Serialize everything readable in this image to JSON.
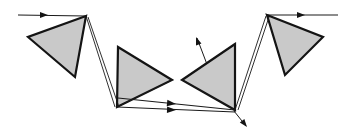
{
  "figure": {
    "width": 342,
    "height": 137,
    "background_color": "#ffffff"
  },
  "style": {
    "prism_fill": "#c9c9c9",
    "prism_stroke": "#141414",
    "prism_stroke_width": 2.2,
    "ray_stroke": "#1a1a1a",
    "ray_stroke_width": 1.1,
    "thin_ray_stroke_width": 0.9,
    "arrow_fill": "#141414"
  },
  "chart_data": {
    "type": "diagram",
    "xlabel": "",
    "ylabel": "",
    "xlim": [
      0,
      342
    ],
    "ylim": [
      0,
      137
    ],
    "grid": false,
    "legend": "none",
    "prisms": [
      {
        "name": "prism-1",
        "label": "upper-left prism",
        "points": "86,16 28,37 75,77",
        "fill": "#c9c9c9"
      },
      {
        "name": "prism-2",
        "label": "lower-left-center prism",
        "points": "118,47 172,80 117,107",
        "fill": "#c9c9c9"
      },
      {
        "name": "prism-3",
        "label": "lower-right-center prism",
        "points": "235,44 182,80 235,110",
        "fill": "#c9c9c9"
      },
      {
        "name": "prism-4",
        "label": "upper-right prism",
        "points": "267,15 323,37 285,75",
        "fill": "#c9c9c9"
      }
    ],
    "rays": [
      {
        "name": "input-ray",
        "label": "incoming beam from left",
        "path": "M18,15 L86,16",
        "width": 1.2,
        "arrows": [
          {
            "name": "input-ray-arrowhead",
            "x": 48,
            "y": 15,
            "angle": 0,
            "size": 8
          }
        ]
      },
      {
        "name": "descending-ray-a",
        "label": "beam from prism 1 apex to prism 2 base (upper)",
        "path": "M86,16 L115,107",
        "width": 0.9,
        "arrows": []
      },
      {
        "name": "descending-ray-b",
        "label": "beam from prism 1 apex to prism 2 base (lower)",
        "path": "M88,17 L119,107",
        "width": 0.9,
        "arrows": []
      },
      {
        "name": "prism2-internal-ray",
        "label": "internal beam across prism 2 to right vertex",
        "path": "M117,107 L172,80",
        "width": 0.9,
        "arrows": []
      },
      {
        "name": "horizontal-ray-upper",
        "label": "upper horizontal beam between prism 2 and prism 3",
        "path": "M118,98 L235,110",
        "width": 1.1,
        "arrows": [
          {
            "name": "horizontal-ray-upper-arrowhead",
            "x": 176,
            "y": 104,
            "angle": 6,
            "size": 9
          }
        ]
      },
      {
        "name": "horizontal-ray-lower",
        "label": "lower horizontal beam between prism 2 and prism 3",
        "path": "M117,107 L235,112",
        "width": 1.1,
        "arrows": [
          {
            "name": "horizontal-ray-lower-arrowhead",
            "x": 176,
            "y": 110,
            "angle": 2,
            "size": 9
          }
        ]
      },
      {
        "name": "prism3-internal-ray",
        "label": "internal beam across prism 3 from base to left",
        "path": "M235,110 L182,80",
        "width": 0.9,
        "arrows": []
      },
      {
        "name": "ascending-ray-a",
        "label": "beam from prism 3 base to prism 4 apex (left)",
        "path": "M235,110 L266,16",
        "width": 0.9,
        "arrows": []
      },
      {
        "name": "ascending-ray-b",
        "label": "beam from prism 3 base to prism 4 apex (right)",
        "path": "M238,110 L269,17",
        "width": 0.9,
        "arrows": []
      },
      {
        "name": "output-ray",
        "label": "outgoing beam to the right",
        "path": "M267,15 L338,15",
        "width": 1.2,
        "arrows": [
          {
            "name": "output-ray-arrowhead",
            "x": 305,
            "y": 15,
            "angle": 0,
            "size": 8
          }
        ]
      },
      {
        "name": "up-escape-ray",
        "label": "stray beam escaping upward-left from prism 3",
        "path": "M208,67 L197,38",
        "width": 1.0,
        "arrows": [
          {
            "name": "up-escape-ray-arrowhead",
            "x": 196,
            "y": 37,
            "angle": -110,
            "size": 8
          }
        ]
      },
      {
        "name": "down-escape-ray",
        "label": "stray beam escaping downward-right from prism 3 base",
        "path": "M234,111 L246,126",
        "width": 1.0,
        "arrows": [
          {
            "name": "down-escape-ray-arrowhead",
            "x": 247,
            "y": 127,
            "angle": 52,
            "size": 8
          }
        ]
      }
    ]
  }
}
